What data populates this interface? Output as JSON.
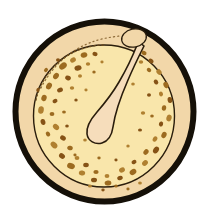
{
  "figure": {
    "kind": "diagram",
    "canvas": {
      "width": 209,
      "height": 218,
      "background": "#ffffff"
    },
    "colors": {
      "background": "#ffffff",
      "outline_black": "#151008",
      "outer_ring_fill": "#f2d7a9",
      "inner_oval_fill": "#f9e6ab",
      "central_band_fill": "#f6ddbb",
      "pigment_spot": "#9c6b20",
      "pigment_spot_dark": "#865316",
      "pigment_spot_light": "#b08030",
      "thin_outline": "#2a1d0c"
    },
    "structures": [
      {
        "name": "outer-boundary-ring",
        "label": "Outer boundary ring",
        "shape": "circle",
        "cx": 104.5,
        "cy": 111,
        "rx": 92,
        "ry": 93,
        "stroke": "#151008",
        "stroke_width": 6,
        "fill": "#f2d7a9"
      },
      {
        "name": "inner-oval-region",
        "label": "Inner oval region",
        "shape": "ellipse",
        "cx": 104,
        "cy": 116,
        "rx": 72,
        "ry": 73,
        "stroke": "#2a1d0c",
        "stroke_width": 1.4,
        "fill": "#f9e6ab"
      },
      {
        "name": "dotted-boundary-arc",
        "label": "Dotted boundary arc (upper-left)",
        "shape": "dashed-arc",
        "stroke": "#6b4a1c",
        "dash": "1.4 2.6"
      },
      {
        "name": "central-hook-band",
        "label": "Central hook-shaped band",
        "shape": "path",
        "fill": "#f6ddbb",
        "stroke": "#2a1d0c",
        "stroke_width": 1.5
      },
      {
        "name": "apical-loop",
        "label": "Apical loop",
        "shape": "ellipse",
        "cx": 133,
        "cy": 38,
        "rx": 12,
        "ry": 9,
        "stroke": "#2a1d0c",
        "stroke_width": 1.3,
        "fill": "#f2d7a9"
      }
    ],
    "pigment_spots": [
      {
        "cx": 84,
        "cy": 55,
        "rx": 3.4,
        "ry": 2.6,
        "rot": -18
      },
      {
        "cx": 95,
        "cy": 54,
        "rx": 2.6,
        "ry": 2.1,
        "rot": 10
      },
      {
        "cx": 73,
        "cy": 60,
        "rx": 3.0,
        "ry": 2.4,
        "rot": -30
      },
      {
        "cx": 63,
        "cy": 66,
        "rx": 4.2,
        "ry": 3.0,
        "rot": -40
      },
      {
        "cx": 78,
        "cy": 68,
        "rx": 3.6,
        "ry": 2.6,
        "rot": -12
      },
      {
        "cx": 88,
        "cy": 64,
        "rx": 2.2,
        "ry": 1.8,
        "rot": 0
      },
      {
        "cx": 56,
        "cy": 76,
        "rx": 3.4,
        "ry": 2.6,
        "rot": -55
      },
      {
        "cx": 68,
        "cy": 78,
        "rx": 2.9,
        "ry": 2.3,
        "rot": 20
      },
      {
        "cx": 80,
        "cy": 76,
        "rx": 2.0,
        "ry": 1.7,
        "rot": 0
      },
      {
        "cx": 49,
        "cy": 86,
        "rx": 3.6,
        "ry": 2.7,
        "rot": -60
      },
      {
        "cx": 60,
        "cy": 90,
        "rx": 3.0,
        "ry": 2.3,
        "rot": -25
      },
      {
        "cx": 72,
        "cy": 88,
        "rx": 2.2,
        "ry": 1.8,
        "rot": 0
      },
      {
        "cx": 44,
        "cy": 98,
        "rx": 3.2,
        "ry": 2.6,
        "rot": -70
      },
      {
        "cx": 55,
        "cy": 101,
        "rx": 2.6,
        "ry": 2.1,
        "rot": -30
      },
      {
        "cx": 41,
        "cy": 110,
        "rx": 3.8,
        "ry": 2.8,
        "rot": -80
      },
      {
        "cx": 52,
        "cy": 114,
        "rx": 2.4,
        "ry": 2.0,
        "rot": 0
      },
      {
        "cx": 43,
        "cy": 122,
        "rx": 3.0,
        "ry": 2.4,
        "rot": 75
      },
      {
        "cx": 56,
        "cy": 127,
        "rx": 3.4,
        "ry": 2.6,
        "rot": 40
      },
      {
        "cx": 48,
        "cy": 134,
        "rx": 2.6,
        "ry": 2.1,
        "rot": 60
      },
      {
        "cx": 63,
        "cy": 138,
        "rx": 3.0,
        "ry": 2.4,
        "rot": 30
      },
      {
        "cx": 54,
        "cy": 145,
        "rx": 3.8,
        "ry": 2.8,
        "rot": 45
      },
      {
        "cx": 70,
        "cy": 148,
        "rx": 2.8,
        "ry": 2.2,
        "rot": 15
      },
      {
        "cx": 62,
        "cy": 156,
        "rx": 3.2,
        "ry": 2.5,
        "rot": 35
      },
      {
        "cx": 77,
        "cy": 158,
        "rx": 2.4,
        "ry": 2.0,
        "rot": 0
      },
      {
        "cx": 71,
        "cy": 166,
        "rx": 4.0,
        "ry": 2.9,
        "rot": 20
      },
      {
        "cx": 86,
        "cy": 165,
        "rx": 2.8,
        "ry": 2.2,
        "rot": 0
      },
      {
        "cx": 82,
        "cy": 173,
        "rx": 3.2,
        "ry": 2.5,
        "rot": 10
      },
      {
        "cx": 96,
        "cy": 172,
        "rx": 2.6,
        "ry": 2.1,
        "rot": 0
      },
      {
        "cx": 94,
        "cy": 180,
        "rx": 3.0,
        "ry": 2.3,
        "rot": 0
      },
      {
        "cx": 107,
        "cy": 176,
        "rx": 2.4,
        "ry": 2.0,
        "rot": 0
      },
      {
        "cx": 108,
        "cy": 183,
        "rx": 3.4,
        "ry": 2.5,
        "rot": -10
      },
      {
        "cx": 120,
        "cy": 178,
        "rx": 2.8,
        "ry": 2.2,
        "rot": -20
      },
      {
        "cx": 122,
        "cy": 170,
        "rx": 3.0,
        "ry": 2.4,
        "rot": -25
      },
      {
        "cx": 133,
        "cy": 172,
        "rx": 3.6,
        "ry": 2.7,
        "rot": -35
      },
      {
        "cx": 134,
        "cy": 162,
        "rx": 2.6,
        "ry": 2.1,
        "rot": -30
      },
      {
        "cx": 145,
        "cy": 163,
        "rx": 3.2,
        "ry": 2.5,
        "rot": -45
      },
      {
        "cx": 146,
        "cy": 152,
        "rx": 3.0,
        "ry": 2.3,
        "rot": -50
      },
      {
        "cx": 156,
        "cy": 150,
        "rx": 3.6,
        "ry": 2.7,
        "rot": -55
      },
      {
        "cx": 155,
        "cy": 139,
        "rx": 2.8,
        "ry": 2.2,
        "rot": -60
      },
      {
        "cx": 164,
        "cy": 135,
        "rx": 3.2,
        "ry": 2.5,
        "rot": -65
      },
      {
        "cx": 161,
        "cy": 124,
        "rx": 2.6,
        "ry": 2.1,
        "rot": -70
      },
      {
        "cx": 169,
        "cy": 118,
        "rx": 3.4,
        "ry": 2.6,
        "rot": -75
      },
      {
        "cx": 164,
        "cy": 108,
        "rx": 2.8,
        "ry": 2.2,
        "rot": -80
      },
      {
        "cx": 170,
        "cy": 100,
        "rx": 3.0,
        "ry": 2.4,
        "rot": 80
      },
      {
        "cx": 161,
        "cy": 94,
        "rx": 2.4,
        "ry": 2.0,
        "rot": 70
      },
      {
        "cx": 166,
        "cy": 85,
        "rx": 3.2,
        "ry": 2.5,
        "rot": 65
      },
      {
        "cx": 156,
        "cy": 82,
        "rx": 2.6,
        "ry": 2.1,
        "rot": 55
      },
      {
        "cx": 159,
        "cy": 72,
        "rx": 3.0,
        "ry": 2.3,
        "rot": 50
      },
      {
        "cx": 149,
        "cy": 70,
        "rx": 2.4,
        "ry": 2.0,
        "rot": 40
      },
      {
        "cx": 151,
        "cy": 61,
        "rx": 2.8,
        "ry": 2.2,
        "rot": 35
      },
      {
        "cx": 141,
        "cy": 62,
        "rx": 2.2,
        "ry": 1.8,
        "rot": 0
      },
      {
        "cx": 144,
        "cy": 53,
        "rx": 2.6,
        "ry": 2.1,
        "rot": 20
      },
      {
        "cx": 149,
        "cy": 95,
        "rx": 2.0,
        "ry": 1.7,
        "rot": 0
      },
      {
        "cx": 143,
        "cy": 113,
        "rx": 2.2,
        "ry": 1.8,
        "rot": 0
      },
      {
        "cx": 152,
        "cy": 116,
        "rx": 1.8,
        "ry": 1.5,
        "rot": 0
      },
      {
        "cx": 140,
        "cy": 130,
        "rx": 2.0,
        "ry": 1.6,
        "rot": 0
      },
      {
        "cx": 133,
        "cy": 84,
        "rx": 1.8,
        "ry": 1.5,
        "rot": 0
      },
      {
        "cx": 64,
        "cy": 112,
        "rx": 1.9,
        "ry": 1.6,
        "rot": 0
      },
      {
        "cx": 76,
        "cy": 100,
        "rx": 1.7,
        "ry": 1.5,
        "rot": 0
      },
      {
        "cx": 86,
        "cy": 90,
        "rx": 1.6,
        "ry": 1.4,
        "rot": 0
      },
      {
        "cx": 94,
        "cy": 72,
        "rx": 1.7,
        "ry": 1.5,
        "rot": 0
      },
      {
        "cx": 67,
        "cy": 126,
        "rx": 1.8,
        "ry": 1.5,
        "rot": 0
      },
      {
        "cx": 85,
        "cy": 140,
        "rx": 1.8,
        "ry": 1.5,
        "rot": 0
      },
      {
        "cx": 99,
        "cy": 158,
        "rx": 1.7,
        "ry": 1.4,
        "rot": 0
      },
      {
        "cx": 116,
        "cy": 160,
        "rx": 1.6,
        "ry": 1.4,
        "rot": 0
      },
      {
        "cx": 128,
        "cy": 146,
        "rx": 1.7,
        "ry": 1.5,
        "rot": 0
      },
      {
        "cx": 75,
        "cy": 155,
        "rx": 1.6,
        "ry": 1.4,
        "rot": 0
      },
      {
        "cx": 58,
        "cy": 60,
        "rx": 2.0,
        "ry": 1.7,
        "rot": 0
      },
      {
        "cx": 102,
        "cy": 62,
        "rx": 1.6,
        "ry": 1.4,
        "rot": 0
      },
      {
        "cx": 46,
        "cy": 70,
        "rx": 2.2,
        "ry": 1.8,
        "rot": -45
      },
      {
        "cx": 38,
        "cy": 90,
        "rx": 2.0,
        "ry": 1.7,
        "rot": -70
      },
      {
        "cx": 90,
        "cy": 186,
        "rx": 2.0,
        "ry": 1.6,
        "rot": 0
      },
      {
        "cx": 116,
        "cy": 186,
        "rx": 1.8,
        "ry": 1.5,
        "rot": 0
      },
      {
        "cx": 103,
        "cy": 190,
        "rx": 1.7,
        "ry": 1.4,
        "rot": 0
      },
      {
        "cx": 140,
        "cy": 183,
        "rx": 1.9,
        "ry": 1.6,
        "rot": 0
      },
      {
        "cx": 128,
        "cy": 189,
        "rx": 1.6,
        "ry": 1.4,
        "rot": 0
      }
    ]
  }
}
